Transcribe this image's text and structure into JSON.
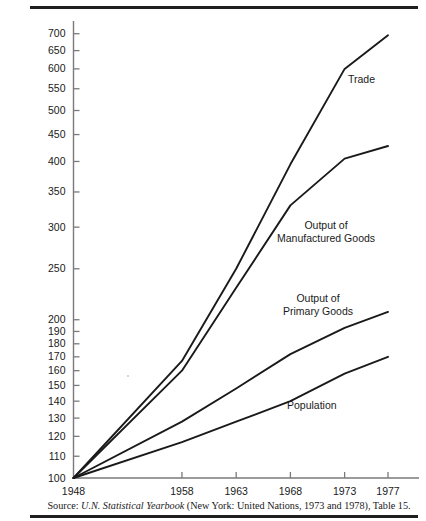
{
  "figure": {
    "source_prefix": "Source: ",
    "source_italic": "U.N. Statistical Yearbook",
    "source_rest": " (New York: United Nations, 1973 and 1978), Table 15.",
    "line_color": "#1a1a1a",
    "axis_color": "#7a7a7a",
    "background": "#ffffff"
  },
  "chart_data": {
    "type": "line",
    "title": "",
    "subtitle": "",
    "xlabel": "",
    "ylabel": "",
    "scale": "log",
    "grid": false,
    "legend_position": "inline-annotations",
    "index_base": "1948 = 100",
    "x": [
      1948,
      1958,
      1963,
      1968,
      1973,
      1977
    ],
    "xtick_labels": [
      "1948",
      "1958",
      "1963",
      "1968",
      "1973",
      "1977"
    ],
    "ytick_labels": [
      "100",
      "110",
      "120",
      "130",
      "140",
      "150",
      "160",
      "170",
      "180",
      "190",
      "200",
      "250",
      "300",
      "350",
      "400",
      "450",
      "500",
      "550",
      "600",
      "650",
      "700"
    ],
    "yticks": [
      100,
      110,
      120,
      130,
      140,
      150,
      160,
      170,
      180,
      190,
      200,
      250,
      300,
      350,
      400,
      450,
      500,
      550,
      600,
      650,
      700
    ],
    "ylim": [
      100,
      740
    ],
    "series": [
      {
        "name": "Trade",
        "values": [
          100,
          167,
          250,
          395,
          600,
          695
        ],
        "label": "Trade"
      },
      {
        "name": "Output of Manufactured Goods",
        "values": [
          100,
          160,
          230,
          330,
          405,
          428
        ],
        "label_line1": "Output of",
        "label_line2": "Manufactured Goods"
      },
      {
        "name": "Output of Primary Goods",
        "values": [
          100,
          128,
          148,
          172,
          193,
          207
        ],
        "label_line1": "Output of",
        "label_line2": "Primary Goods"
      },
      {
        "name": "Population",
        "values": [
          100,
          117,
          128,
          140,
          158,
          170
        ],
        "label": "Population"
      }
    ]
  }
}
